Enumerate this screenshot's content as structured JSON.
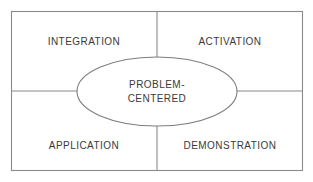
{
  "diagram": {
    "type": "quadrant-with-center-ellipse",
    "frame": {
      "border_color": "#8a8a8a",
      "background_color": "#ffffff"
    },
    "center": {
      "shape": "ellipse",
      "line_1": "PROBLEM-",
      "line_2": "CENTERED",
      "full_text": "PROBLEM-CENTERED",
      "fill_color": "#ffffff",
      "stroke_color": "#7d7d7d"
    },
    "quadrants": [
      {
        "position": "top-left",
        "label": "INTEGRATION"
      },
      {
        "position": "top-right",
        "label": "ACTIVATION"
      },
      {
        "position": "bottom-left",
        "label": "APPLICATION"
      },
      {
        "position": "bottom-right",
        "label": "DEMONSTRATION"
      }
    ],
    "text_color": "#3a3a3a"
  }
}
